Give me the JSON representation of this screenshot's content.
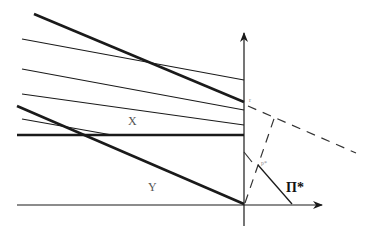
{
  "diagram": {
    "labels": {
      "x_region": "X",
      "y_region": "Y",
      "pi_star": "Π*",
      "p_star": "p*",
      "r": "r"
    },
    "colors": {
      "stroke": "#1a1a1a",
      "dashed": "#333333",
      "background": "#ffffff"
    }
  }
}
